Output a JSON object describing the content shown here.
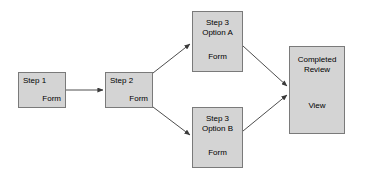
{
  "diagram": {
    "background_color": "#ffffff",
    "node_fill_color": "#d4d4d4",
    "node_border_color": "#7a7a7a",
    "edge_color": "#3a3a3a",
    "nodes": [
      {
        "id": "step1",
        "title": "Step 1",
        "action": "Form"
      },
      {
        "id": "step2",
        "title": "Step 2",
        "action": "Form"
      },
      {
        "id": "optionA",
        "title": "Step 3\nOption A",
        "action": "Form"
      },
      {
        "id": "optionB",
        "title": "Step 3\nOption B",
        "action": "Form"
      },
      {
        "id": "completed",
        "title": "Completed\nReview",
        "action": "View"
      }
    ],
    "edges": [
      {
        "id": "e1",
        "from": "step1",
        "to": "step2",
        "style": "straight-arrow"
      },
      {
        "id": "e2",
        "from": "step2",
        "to": "optionA",
        "style": "diagonal-arrow"
      },
      {
        "id": "e3",
        "from": "step2",
        "to": "optionB",
        "style": "diagonal-arrow"
      },
      {
        "id": "e4",
        "from": "optionA",
        "to": "completed",
        "style": "diagonal-arrow"
      },
      {
        "id": "e5",
        "from": "optionB",
        "to": "completed",
        "style": "diagonal-arrow"
      }
    ]
  }
}
